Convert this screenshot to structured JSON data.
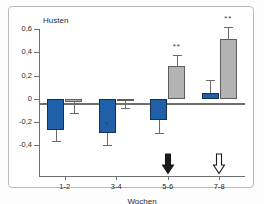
{
  "figure": {
    "ytitle": "Husten",
    "xtitle": "Wochen",
    "caption": ""
  },
  "colors": {
    "series_blue": "#1f60a8",
    "series_gray": "#b3b3b3",
    "axis": "#6f6f6f",
    "frame_border": "#b9b9b9",
    "arrow_filled": "#1a1a1a",
    "arrow_outline": "#ffffff"
  },
  "annotations": {
    "arrow_filled_label": "black-down-arrow",
    "arrow_outline_label": "white-down-arrow",
    "arrow_filled_at": "5-6",
    "arrow_outline_at": "7-8"
  },
  "chart_data": {
    "type": "bar",
    "title": "",
    "ylabel": "Husten",
    "xlabel": "Wochen",
    "ylim": [
      -0.5,
      0.6
    ],
    "yticks": [
      0.6,
      0.4,
      0.2,
      0,
      -0.2,
      -0.4
    ],
    "ytick_labels": [
      "0,6",
      "0,4",
      "0,2",
      "0",
      "-0,2",
      "-0,4"
    ],
    "grid": false,
    "legend": "none",
    "categories": [
      "1-2",
      "3-4",
      "5-6",
      "7-8"
    ],
    "series": [
      {
        "name": "blue",
        "color": "#1f60a8",
        "values": [
          -0.27,
          -0.29,
          -0.185,
          0.05
        ],
        "err_low": [
          -0.365,
          -0.4,
          -0.295,
          -0.01
        ],
        "err_high": [
          -0.27,
          -0.29,
          -0.185,
          0.165
        ],
        "significance": [
          "",
          "*",
          "",
          ""
        ]
      },
      {
        "name": "gray",
        "color": "#b3b3b3",
        "values": [
          -0.03,
          -0.015,
          0.28,
          0.51
        ],
        "err_low": [
          -0.12,
          -0.075,
          0.28,
          0.51
        ],
        "err_high": [
          -0.03,
          -0.015,
          0.38,
          0.615
        ],
        "significance": [
          "",
          "",
          "**",
          "**"
        ]
      }
    ]
  }
}
